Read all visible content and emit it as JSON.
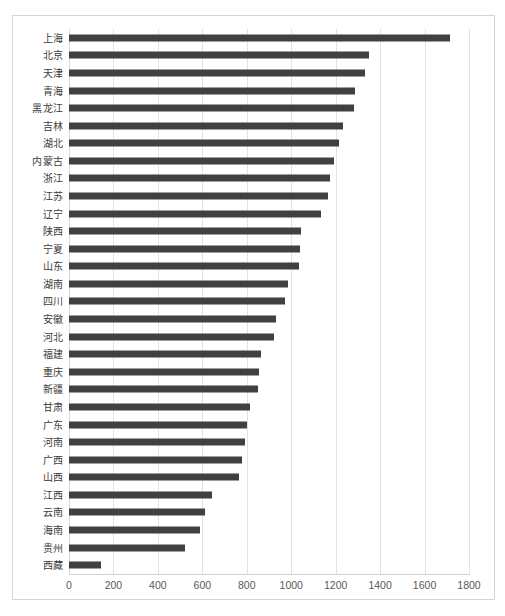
{
  "chart_data": {
    "type": "bar",
    "orientation": "horizontal",
    "title": "",
    "subtitle": "",
    "xlabel": "",
    "ylabel": "",
    "xlim": [
      0,
      1800
    ],
    "xticks": [
      0,
      200,
      400,
      600,
      800,
      1000,
      1200,
      1400,
      1600,
      1800
    ],
    "xtick_labels": [
      "0",
      "200",
      "400",
      "600",
      "800",
      "1000",
      "1200",
      "1400",
      "1600",
      "1800"
    ],
    "grid": true,
    "grid_axis": "x",
    "legend": false,
    "legend_position": "none",
    "bar_color": "#404040",
    "grid_color": "#e2e2e2",
    "border_color": "#d4d4d4",
    "categories": [
      "上海",
      "北京",
      "天津",
      "青海",
      "黑龙江",
      "吉林",
      "湖北",
      "内蒙古",
      "浙江",
      "江苏",
      "辽宁",
      "陕西",
      "宁夏",
      "山东",
      "湖南",
      "四川",
      "安徽",
      "河北",
      "福建",
      "重庆",
      "新疆",
      "甘肃",
      "广东",
      "河南",
      "广西",
      "山西",
      "江西",
      "云南",
      "海南",
      "贵州",
      "西藏"
    ],
    "values": [
      1715,
      1350,
      1332,
      1287,
      1282,
      1233,
      1215,
      1193,
      1175,
      1165,
      1134,
      1044,
      1040,
      1035,
      985,
      972,
      932,
      923,
      864,
      855,
      851,
      815,
      801,
      792,
      778,
      765,
      643,
      612,
      590,
      522,
      144
    ]
  }
}
